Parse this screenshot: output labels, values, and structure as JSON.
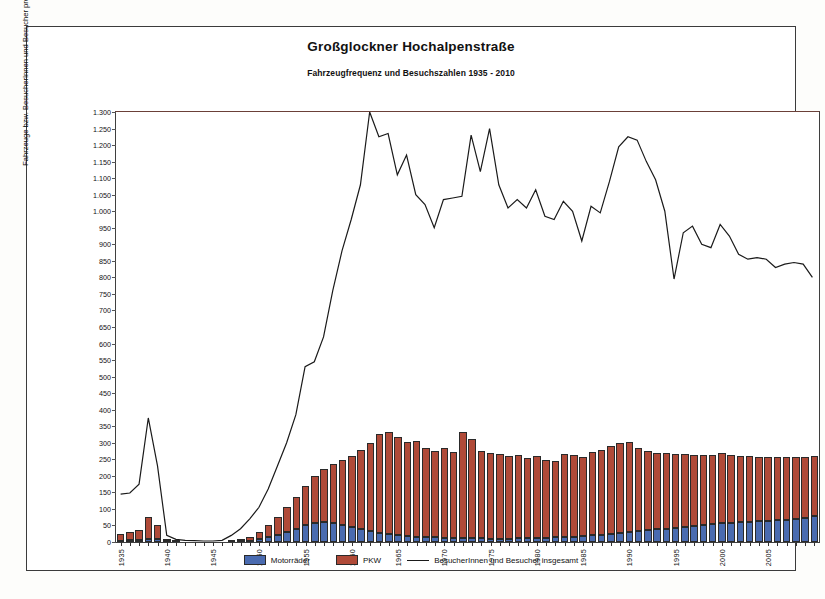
{
  "chart_data": {
    "type": "bar",
    "title": "Großglockner Hochalpenstraße",
    "subtitle": "Fahrzeugfrequenz und Besuchszahlen 1935 - 2010",
    "xlabel": "",
    "ylabel": "Fahrzeuge bzw. BesucherInnen und Besucher pro Jahr (x1000)",
    "ylim": [
      0,
      1300
    ],
    "ytick_step": 50,
    "ytick_labels": [
      "1.300",
      "1.250",
      "1.200",
      "1.150",
      "1.100",
      "1.050",
      "1.000",
      "950",
      "900",
      "850",
      "800",
      "750",
      "700",
      "650",
      "600",
      "550",
      "500",
      "450",
      "400",
      "350",
      "300",
      "250",
      "200",
      "150",
      "100",
      "50",
      "0"
    ],
    "grid": false,
    "legend_position": "bottom",
    "stacked": true,
    "x": [
      1935,
      1936,
      1937,
      1938,
      1939,
      1940,
      1941,
      1942,
      1943,
      1944,
      1945,
      1946,
      1947,
      1948,
      1949,
      1950,
      1951,
      1952,
      1953,
      1954,
      1955,
      1956,
      1957,
      1958,
      1959,
      1960,
      1961,
      1962,
      1963,
      1964,
      1965,
      1966,
      1967,
      1968,
      1969,
      1970,
      1971,
      1972,
      1973,
      1974,
      1975,
      1976,
      1977,
      1978,
      1979,
      1980,
      1981,
      1982,
      1983,
      1984,
      1985,
      1986,
      1987,
      1988,
      1989,
      1990,
      1991,
      1992,
      1993,
      1994,
      1995,
      1996,
      1997,
      1998,
      1999,
      2000,
      2001,
      2002,
      2003,
      2004,
      2005,
      2006,
      2007,
      2008,
      2009,
      2010
    ],
    "xtick_labels": [
      "1935",
      "1940",
      "1945",
      "1950",
      "1955",
      "1960",
      "1965",
      "1970",
      "1975",
      "1980",
      "1985",
      "1990",
      "1995",
      "2000",
      "2005"
    ],
    "xtick_values": [
      1935,
      1940,
      1945,
      1950,
      1955,
      1960,
      1965,
      1970,
      1975,
      1980,
      1985,
      1990,
      1995,
      2000,
      2005
    ],
    "series": [
      {
        "name": "Motorräder",
        "color": "#4a6bb0",
        "values": [
          4,
          5,
          6,
          9,
          8,
          3,
          1,
          0,
          0,
          0,
          0,
          0,
          1,
          2,
          4,
          8,
          14,
          21,
          30,
          40,
          50,
          58,
          60,
          58,
          52,
          45,
          38,
          32,
          27,
          23,
          20,
          18,
          16,
          15,
          14,
          13,
          12,
          12,
          11,
          11,
          10,
          10,
          10,
          11,
          11,
          12,
          13,
          14,
          15,
          16,
          18,
          20,
          22,
          25,
          28,
          31,
          34,
          36,
          38,
          40,
          42,
          45,
          48,
          52,
          55,
          56,
          58,
          60,
          62,
          63,
          64,
          66,
          68,
          70,
          74,
          80
        ]
      },
      {
        "name": "PKW",
        "color": "#b04a38",
        "values": [
          21,
          25,
          29,
          66,
          42,
          4,
          1,
          0,
          0,
          0,
          0,
          0,
          2,
          5,
          11,
          22,
          36,
          54,
          75,
          95,
          120,
          142,
          160,
          178,
          196,
          215,
          240,
          268,
          300,
          310,
          298,
          285,
          290,
          268,
          262,
          272,
          260,
          322,
          300,
          265,
          258,
          255,
          250,
          252,
          243,
          248,
          235,
          230,
          250,
          248,
          240,
          252,
          255,
          265,
          272,
          270,
          250,
          240,
          232,
          228,
          225,
          220,
          215,
          210,
          208,
          212,
          205,
          200,
          198,
          195,
          192,
          190,
          188,
          186,
          184,
          180
        ]
      }
    ],
    "line_series": {
      "name": "BesucherInnen und Besucher insgesamt",
      "color": "#1a1a1a",
      "values": [
        145,
        148,
        175,
        375,
        230,
        20,
        8,
        5,
        4,
        3,
        3,
        5,
        20,
        40,
        70,
        105,
        160,
        230,
        300,
        385,
        530,
        545,
        620,
        760,
        880,
        975,
        1080,
        1300,
        1225,
        1235,
        1110,
        1170,
        1050,
        1020,
        950,
        1035,
        1040,
        1045,
        1230,
        1120,
        1250,
        1080,
        1010,
        1035,
        1010,
        1065,
        985,
        975,
        1030,
        1000,
        910,
        1015,
        995,
        1090,
        1195,
        1225,
        1215,
        1150,
        1095,
        1000,
        795,
        935,
        955,
        900,
        890,
        960,
        925,
        870,
        855,
        860,
        855,
        830,
        840,
        845,
        840,
        800
      ]
    }
  },
  "legend": {
    "items": [
      {
        "label": "Motorräder",
        "type": "swatch"
      },
      {
        "label": "PKW",
        "type": "swatch"
      },
      {
        "label": "BesucherInnen und Besucher insgesamt",
        "type": "line"
      }
    ]
  }
}
